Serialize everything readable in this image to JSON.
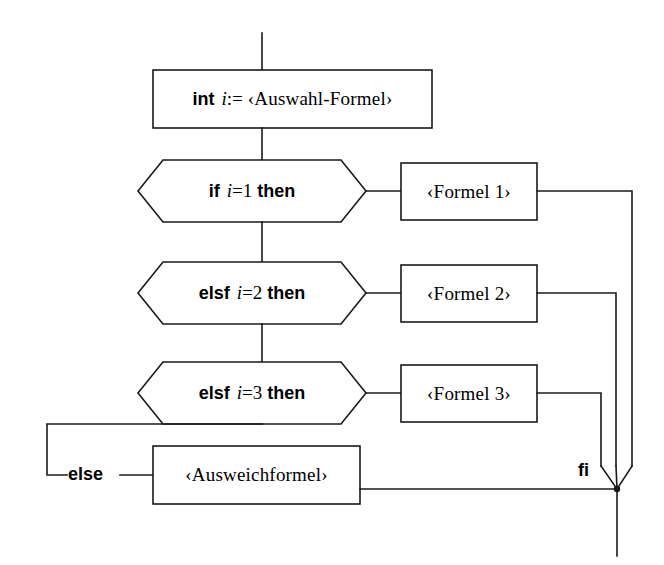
{
  "diagram": {
    "language": "de",
    "stroke_color": "#1a1a1a",
    "fill_color": "#ffffff",
    "text_color": "#000000",
    "nodes": {
      "declaration": {
        "shape": "rectangle",
        "keyword": "int",
        "variable": "i",
        "operator": ":=",
        "value": "‹Auswahl-Formel›"
      },
      "cond1": {
        "shape": "hexagon",
        "keyword_open": "if",
        "variable": "i",
        "operator": "=",
        "number": "1",
        "keyword_close": "then"
      },
      "cond2": {
        "shape": "hexagon",
        "keyword_open": "elsf",
        "variable": "i",
        "operator": "=",
        "number": "2",
        "keyword_close": "then"
      },
      "cond3": {
        "shape": "hexagon",
        "keyword_open": "elsf",
        "variable": "i",
        "operator": "=",
        "number": "3",
        "keyword_close": "then"
      },
      "formula1": {
        "shape": "rectangle",
        "label": "‹Formel 1›"
      },
      "formula2": {
        "shape": "rectangle",
        "label": "‹Formel 2›"
      },
      "formula3": {
        "shape": "rectangle",
        "label": "‹Formel 3›"
      },
      "else_keyword": {
        "label": "else"
      },
      "fallback": {
        "shape": "rectangle",
        "label": "‹Ausweichformel›"
      },
      "fi_keyword": {
        "label": "fi"
      }
    }
  }
}
